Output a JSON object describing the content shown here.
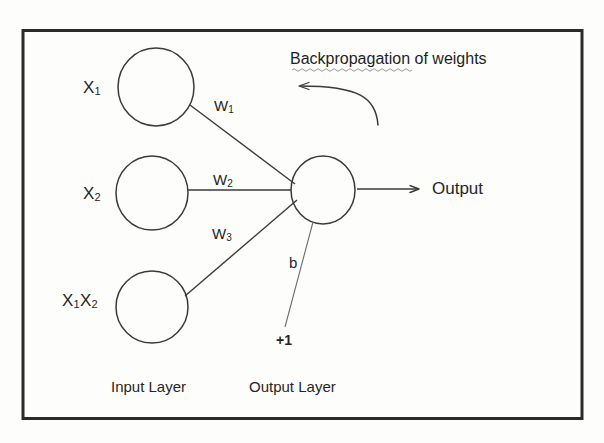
{
  "diagram": {
    "frame": {
      "stroke": "#2b2b2b"
    },
    "ink": "#3a3a3a",
    "text_color": "#262626",
    "spellcheck_underline_color": "#9a9a9a",
    "input_layer": {
      "caption": "Input Layer",
      "nodes": [
        {
          "label_main": "X",
          "label_sub": "1",
          "name": "input-node-x1"
        },
        {
          "label_main": "X",
          "label_sub": "2",
          "name": "input-node-x2"
        },
        {
          "label_main": "X",
          "label_sub": "1",
          "label_main2": "X",
          "label_sub2": "2",
          "name": "input-node-x1x2"
        }
      ]
    },
    "output_layer": {
      "caption": "Output Layer",
      "node_name": "output-node",
      "output_text": "Output"
    },
    "weights": [
      {
        "label_main": "W",
        "label_sub": "1"
      },
      {
        "label_main": "W",
        "label_sub": "2"
      },
      {
        "label_main": "W",
        "label_sub": "3"
      }
    ],
    "bias": {
      "label": "b",
      "source_label": "+1"
    },
    "annotation": {
      "text": "Backpropagation of weights",
      "misspelled_word": "Backpropagation"
    }
  }
}
